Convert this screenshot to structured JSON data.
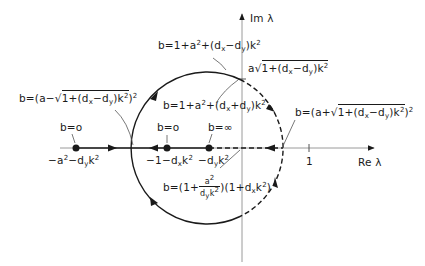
{
  "axes": {
    "imag_label": "Im λ",
    "real_label": "Re λ",
    "real_tick_label": "1"
  },
  "points": [
    {
      "b_label": "b=o",
      "coord_label": "-a²-dyk²"
    },
    {
      "b_label": "b=o",
      "coord_label": "-1-dxk²"
    },
    {
      "b_label": "b=∞",
      "coord_label": "-dyk²"
    }
  ],
  "annotations": {
    "top_b": "b=1+a²+(dx-dy)k²",
    "imag_intercept": "a√(1+(dx-dy)k²)",
    "inner_b": "b=1+a²+(dx+dy)k²",
    "left_crossing": "b=(a-√(1+(dx-dy)k²))²",
    "right_crossing": "b=(a+√(1+(dx-dy)k²))²",
    "axis_crossing": "b=(1+a²/(dyk²))(1+dxk²)"
  },
  "colors": {
    "ink": "#1a1a1a",
    "axis": "#9a9a9a"
  }
}
